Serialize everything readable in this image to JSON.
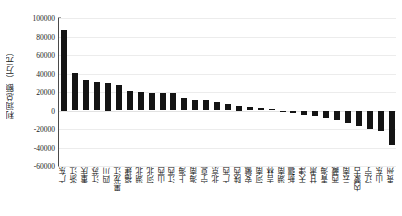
{
  "chart_data": {
    "type": "bar",
    "title": "",
    "xlabel": "",
    "ylabel": "利润总额（万元）",
    "ylim": [
      -60000,
      100000
    ],
    "yticks": [
      100000,
      80000,
      60000,
      40000,
      20000,
      0,
      -20000,
      -40000,
      -60000
    ],
    "ytick_labels": [
      "100000",
      "80000",
      "60000",
      "40000",
      "20000",
      "0",
      "-20000",
      "-40000",
      "-60000"
    ],
    "grid": true,
    "legend": "none",
    "bar_color": "#141414",
    "grid_color": "#ececec",
    "axis_color": "#4a4a4a",
    "categories": [
      "广东",
      "浙江",
      "重庆",
      "江苏",
      "四川",
      "黑龙江",
      "福建",
      "湖北",
      "河北",
      "山西",
      "江西",
      "上海",
      "海南",
      "宁夏",
      "北京",
      "广西",
      "陕西",
      "安徽",
      "河南",
      "吉林",
      "湖南",
      "新疆",
      "天津",
      "甘肃",
      "青海",
      "西藏",
      "云南",
      "内蒙古",
      "辽宁",
      "山东",
      "贵州"
    ],
    "values": [
      87500,
      41000,
      33000,
      30500,
      30000,
      28000,
      21000,
      19500,
      19000,
      19000,
      18500,
      13000,
      11500,
      11000,
      9000,
      7000,
      5000,
      4000,
      3000,
      2000,
      -1500,
      -3000,
      -4500,
      -6000,
      -8000,
      -10000,
      -13000,
      -17000,
      -20000,
      -22000,
      -37000
    ],
    "value_unit": "万元",
    "series_name": "利润总额"
  }
}
